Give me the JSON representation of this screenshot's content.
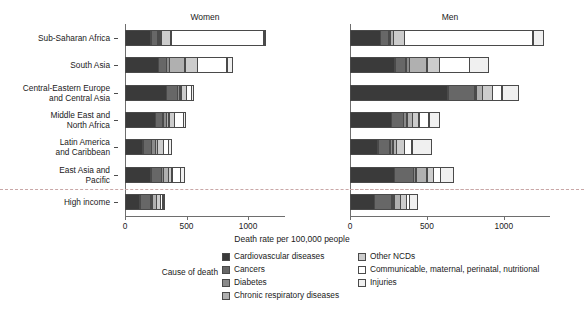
{
  "chart_data": {
    "type": "bar",
    "orientation": "horizontal",
    "stacked": true,
    "title": "",
    "xlabel": "Death rate per 100,000 people",
    "ylabel": "",
    "xlim": [
      0,
      1300
    ],
    "xticks": [
      0,
      500,
      1000
    ],
    "xtick_labels": [
      "0",
      "500",
      "1000"
    ],
    "grid": false,
    "legend_title": "Cause of death",
    "legend_position": "bottom",
    "panels": [
      "Women",
      "Men"
    ],
    "categories": [
      "Sub-Saharan Africa",
      "South Asia",
      "Central-Eastern Europe\nand Central Asia",
      "Middle East and\nNorth Africa",
      "Latin America\nand  Caribbean",
      "East Asia and\nPacific",
      "High income"
    ],
    "series": [
      {
        "name": "Cardiovascular diseases",
        "color": "#3a3a3a"
      },
      {
        "name": "Cancers",
        "color": "#676767"
      },
      {
        "name": "Diabetes",
        "color": "#8a8a8a"
      },
      {
        "name": "Chronic respiratory diseases",
        "color": "#b0b0b0"
      },
      {
        "name": "Other NCDs",
        "color": "#cccccc"
      },
      {
        "name": "Communicable, maternal, perinatal, nutritional",
        "color": "#ffffff"
      },
      {
        "name": "Injuries",
        "color": "#f0f0f0"
      }
    ],
    "values": {
      "Women": [
        {
          "category": "Sub-Saharan Africa",
          "segments": [
            215,
            60,
            20,
            15,
            85,
            760,
            20
          ],
          "total": 1175
        },
        {
          "category": "South Asia",
          "segments": [
            275,
            70,
            30,
            130,
            105,
            245,
            55
          ],
          "total": 910
        },
        {
          "category": "Central-Eastern Europe\nand Central Asia",
          "segments": [
            340,
            95,
            25,
            15,
            45,
            45,
            25
          ],
          "total": 590
        },
        {
          "category": "Middle East and\nNorth Africa",
          "segments": [
            250,
            65,
            35,
            25,
            50,
            75,
            25
          ],
          "total": 525
        },
        {
          "category": "Latin America\nand  Caribbean",
          "segments": [
            150,
            75,
            35,
            20,
            55,
            45,
            30
          ],
          "total": 410
        },
        {
          "category": "East Asia and\nPacific",
          "segments": [
            215,
            90,
            20,
            45,
            35,
            75,
            40
          ],
          "total": 520
        },
        {
          "category": "High income",
          "segments": [
            125,
            95,
            15,
            35,
            40,
            25,
            20
          ],
          "total": 355
        }
      ],
      "Men": [
        {
          "category": "Sub-Saharan Africa",
          "segments": [
            200,
            55,
            15,
            25,
            75,
            840,
            75
          ],
          "total": 1285
        },
        {
          "category": "South Asia",
          "segments": [
            295,
            75,
            25,
            120,
            85,
            200,
            130
          ],
          "total": 930
        },
        {
          "category": "Central-Eastern Europe\nand Central Asia",
          "segments": [
            640,
            175,
            15,
            45,
            70,
            65,
            110
          ],
          "total": 1120
        },
        {
          "category": "Middle East and\nNorth Africa",
          "segments": [
            270,
            85,
            25,
            40,
            45,
            70,
            75
          ],
          "total": 610
        },
        {
          "category": "Latin America\nand  Caribbean",
          "segments": [
            185,
            80,
            25,
            25,
            55,
            55,
            130
          ],
          "total": 555
        },
        {
          "category": "East Asia and\nPacific",
          "segments": [
            290,
            130,
            20,
            75,
            45,
            50,
            90
          ],
          "total": 700
        },
        {
          "category": "High income",
          "segments": [
            160,
            120,
            15,
            45,
            45,
            25,
            55
          ],
          "total": 465
        }
      ]
    }
  },
  "panels": {
    "women": {
      "title": "Women"
    },
    "men": {
      "title": "Men"
    }
  },
  "axis": {
    "x_title": "Death rate per 100,000 people",
    "tick_0": "0",
    "tick_500": "500",
    "tick_1000": "1000"
  },
  "categories": [
    {
      "label": "Sub-Saharan Africa"
    },
    {
      "label": "South Asia"
    },
    {
      "label": "Central-Eastern Europe\nand Central Asia"
    },
    {
      "label": "Middle East and\nNorth Africa"
    },
    {
      "label": "Latin America\nand  Caribbean"
    },
    {
      "label": "East Asia and\nPacific"
    },
    {
      "label": "High income"
    }
  ],
  "legend": {
    "title": "Cause of death",
    "left_column": [
      {
        "label": "Cardiovascular diseases",
        "color": "#3a3a3a"
      },
      {
        "label": "Cancers",
        "color": "#676767"
      },
      {
        "label": "Diabetes",
        "color": "#8a8a8a"
      },
      {
        "label": "Chronic respiratory diseases",
        "color": "#b0b0b0"
      }
    ],
    "right_column": [
      {
        "label": "Other NCDs",
        "color": "#cccccc"
      },
      {
        "label": "Communicable, maternal, perinatal, nutritional",
        "color": "#ffffff"
      },
      {
        "label": "Injuries",
        "color": "#f0f0f0"
      }
    ]
  }
}
